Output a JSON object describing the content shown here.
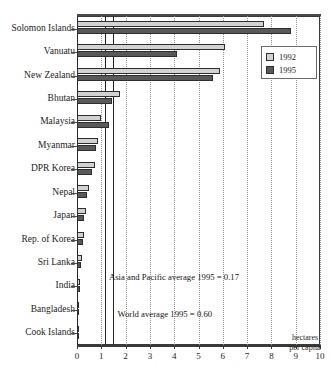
{
  "chart_data": {
    "type": "bar",
    "orientation": "horizontal",
    "title": "",
    "xlabel": "hectares per capita",
    "ylabel": "",
    "xlim": [
      0,
      10
    ],
    "xticks": [
      0,
      1,
      2,
      3,
      4,
      5,
      6,
      7,
      8,
      9,
      10
    ],
    "grid": "vertical dotted gridlines at each integer tick",
    "legend_position": "top-right inside plot",
    "categories": [
      "Solomon Islands",
      "Vanuatu",
      "New Zealand",
      "Bhutan",
      "Malaysia",
      "Myanmar",
      "DPR Korea",
      "Nepal",
      "Japan",
      "Rep. of Korea",
      "Sri Lanka",
      "India",
      "Bangladesh",
      "Cook Islands"
    ],
    "series": [
      {
        "name": "1992",
        "color": "#d2d2d2",
        "values": [
          7.7,
          6.1,
          5.9,
          1.75,
          1.0,
          0.88,
          0.73,
          0.5,
          0.36,
          0.28,
          0.2,
          0.14,
          0.09,
          0.05
        ]
      },
      {
        "name": "1995",
        "color": "#595959",
        "values": [
          8.8,
          4.1,
          5.6,
          1.45,
          1.3,
          0.8,
          0.6,
          0.43,
          0.3,
          0.24,
          0.17,
          0.12,
          0.07,
          0.04
        ]
      }
    ],
    "reference_lines": [
      {
        "label": "Asia and Pacific average 1995 = 0.17",
        "value": 1.15,
        "style": "solid"
      },
      {
        "label": "World average 1995 = 0.60",
        "value": 1.5,
        "style": "solid"
      }
    ],
    "annotations": [
      "Asia and Pacific average 1995 = 0.17",
      "World average 1995 = 0.60"
    ]
  },
  "axis": {
    "x_title_line1": "hectares",
    "x_title_line2": "per capita"
  },
  "legend": {
    "items": [
      {
        "label": "1992"
      },
      {
        "label": "1995"
      }
    ]
  }
}
